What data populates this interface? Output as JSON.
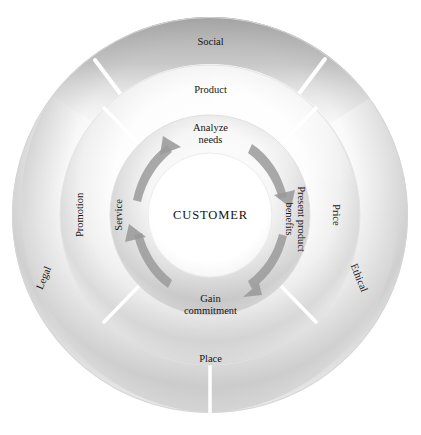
{
  "diagram": {
    "type": "concentric-ring-wheel",
    "center": {
      "label": "CUSTOMER"
    },
    "rings": [
      {
        "name": "inner-ring",
        "description": "selling process steps with clockwise arrows",
        "segments": [
          {
            "id": "analyze-needs",
            "label": "Analyze\nneeds",
            "line1": "Analyze",
            "line2": "needs",
            "position": "top"
          },
          {
            "id": "present-product-benefits",
            "label": "Present product benefits",
            "line1": "Present product",
            "line2": "benefits",
            "position": "right"
          },
          {
            "id": "gain-commitment",
            "label": "Gain\ncommitment",
            "line1": "Gain",
            "line2": "commitment",
            "position": "bottom"
          },
          {
            "id": "service",
            "label": "Service",
            "position": "left"
          }
        ],
        "arrows": 4,
        "arrow_direction": "clockwise",
        "arrow_color": "#9a9a9a"
      },
      {
        "name": "middle-ring",
        "description": "marketing mix",
        "segments": [
          {
            "id": "product",
            "label": "Product",
            "position": "top"
          },
          {
            "id": "price",
            "label": "Price",
            "position": "right"
          },
          {
            "id": "place",
            "label": "Place",
            "position": "bottom"
          },
          {
            "id": "promotion",
            "label": "Promotion",
            "position": "left"
          }
        ]
      },
      {
        "name": "outer-ring",
        "description": "external environment forces",
        "segments": [
          {
            "id": "social",
            "label": "Social",
            "position": "top"
          },
          {
            "id": "ethical",
            "label": "Ethical",
            "position": "lower-right"
          },
          {
            "id": "legal",
            "label": "Legal",
            "position": "lower-left"
          }
        ]
      }
    ],
    "colors": {
      "background": "#ffffff",
      "outer_ring_dark": "#9c9c9c",
      "outer_ring_light": "#f2f2f2",
      "middle_ring_light": "#fbfbfb",
      "middle_ring_shadow": "#cfcfcf",
      "inner_ring_shadow": "#c6c6c6",
      "center_fill": "#ffffff",
      "text": "#151515",
      "arrow": "#9a9a9a"
    }
  },
  "labels": {
    "social": "Social",
    "product": "Product",
    "analyze_needs_l1": "Analyze",
    "analyze_needs_l2": "needs",
    "customer": "CUSTOMER",
    "present_benefits_l1": "Present product",
    "present_benefits_l2": "benefits",
    "price": "Price",
    "ethical": "Ethical",
    "gain_commitment_l1": "Gain",
    "gain_commitment_l2": "commitment",
    "place": "Place",
    "service": "Service",
    "promotion": "Promotion",
    "legal": "Legal"
  }
}
